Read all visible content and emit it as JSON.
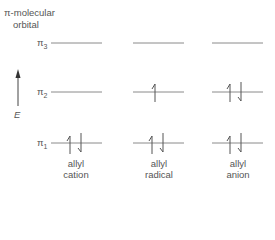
{
  "header": {
    "line1": "π-molecular",
    "line2": "orbital"
  },
  "axis": {
    "label": "E",
    "direction": "up"
  },
  "levels": [
    {
      "name": "π",
      "sub": "3",
      "y": 43
    },
    {
      "name": "π",
      "sub": "2",
      "y": 92
    },
    {
      "name": "π",
      "sub": "1",
      "y": 143
    }
  ],
  "columns": [
    {
      "line1": "allyl",
      "line2": "cation",
      "x1": 51,
      "x2": 102,
      "occupancy": {
        "pi3": 0,
        "pi2": 0,
        "pi1": 2
      }
    },
    {
      "line1": "allyl",
      "line2": "radical",
      "x1": 133,
      "x2": 184,
      "occupancy": {
        "pi3": 0,
        "pi2": 1,
        "pi1": 2
      }
    },
    {
      "line1": "allyl",
      "line2": "anion",
      "x1": 212,
      "x2": 263,
      "occupancy": {
        "pi3": 0,
        "pi2": 2,
        "pi1": 2
      }
    }
  ],
  "colors": {
    "line": "#8a8a8a",
    "text": "#555555"
  }
}
